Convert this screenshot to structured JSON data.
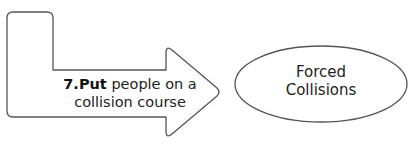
{
  "diagram": {
    "arrow": {
      "number": "7.",
      "bold_word": "Put",
      "line1_rest": " people on a",
      "line2": "collision course",
      "stroke": "#555555"
    },
    "ellipse": {
      "line1": "Forced",
      "line2": "Collisions",
      "stroke": "#555555"
    }
  }
}
